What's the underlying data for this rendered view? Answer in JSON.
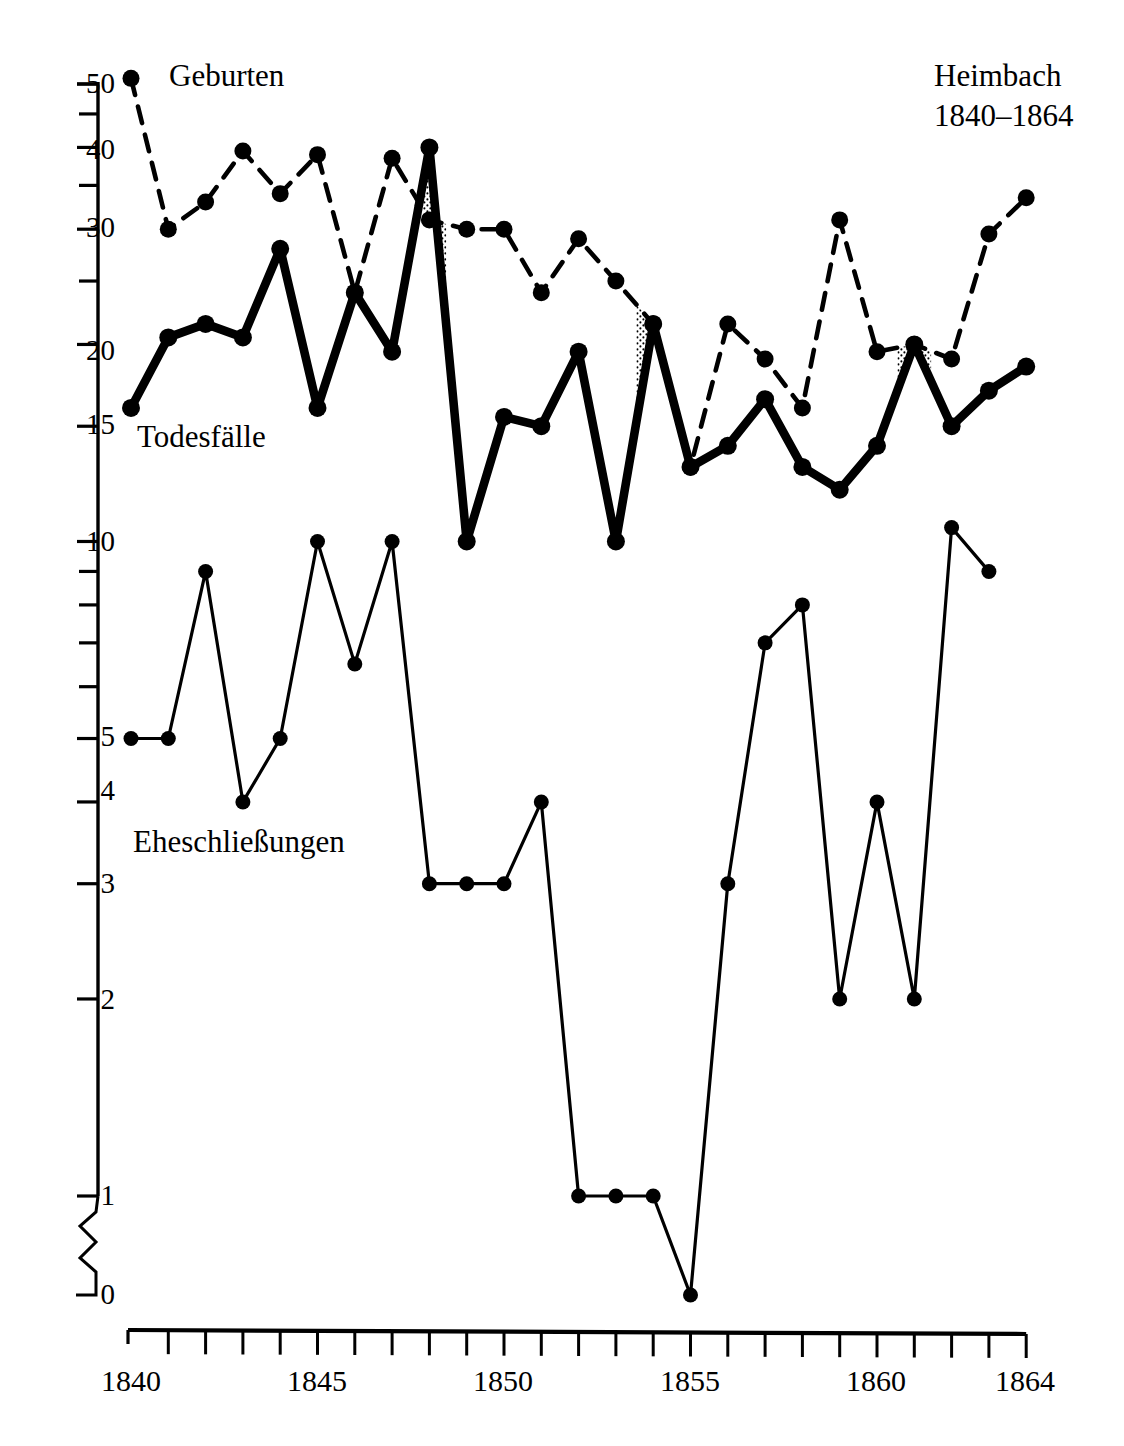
{
  "chart_data": {
    "type": "line",
    "title": "Heimbach",
    "subtitle": "1840–1864",
    "xlabel": "",
    "ylabel": "",
    "scale": "logarithmic",
    "grid": false,
    "legend_position": "inline-annotations",
    "axis_break": "between 1 and 0 on y-axis (zigzag symbol)",
    "xlim": [
      1840,
      1864
    ],
    "ylim": [
      0,
      51
    ],
    "x": [
      1840,
      1841,
      1842,
      1843,
      1844,
      1845,
      1846,
      1847,
      1848,
      1849,
      1850,
      1851,
      1852,
      1853,
      1854,
      1855,
      1856,
      1857,
      1858,
      1859,
      1860,
      1861,
      1862,
      1863,
      1864
    ],
    "xticks_labeled": [
      "1840",
      "1845",
      "1850",
      "1855",
      "1860",
      "1864"
    ],
    "yticks_labeled": [
      "50",
      "40",
      "30",
      "20",
      "15",
      "10",
      "5",
      "4",
      "3",
      "2",
      "1",
      "0"
    ],
    "yticks_minor": [
      45,
      35,
      25,
      9,
      8,
      7,
      6
    ],
    "series": [
      {
        "name": "Geburten",
        "style": "dashed",
        "marker": "filled-circle",
        "values": [
          51,
          30,
          33,
          39.5,
          34,
          39,
          24,
          38.5,
          31,
          30,
          30,
          24,
          29,
          25,
          21.5,
          13,
          21.5,
          19,
          16,
          31,
          19.5,
          20,
          19,
          29.5,
          33.5
        ]
      },
      {
        "name": "Todesfälle",
        "style": "thick-solid",
        "marker": "filled-circle",
        "values": [
          16,
          20.5,
          21.5,
          20.5,
          28,
          16,
          24,
          19.5,
          40,
          10,
          15.5,
          15,
          19.5,
          10,
          21.5,
          13,
          14,
          16.5,
          13,
          12,
          14,
          20,
          15,
          17,
          18.5
        ]
      },
      {
        "name": "Eheschließungen",
        "style": "thin-solid",
        "marker": "filled-circle",
        "values": [
          5,
          5,
          9,
          4,
          5,
          10,
          6.5,
          10,
          3,
          3,
          3,
          4,
          1,
          1,
          1,
          0,
          3,
          7,
          8,
          2,
          4,
          2,
          10.5,
          9,
          null
        ]
      }
    ],
    "shaded_regions": [
      {
        "label": "deaths exceed births",
        "from": 1847.6,
        "to": 1848.45,
        "fill": "stipple"
      },
      {
        "label": "deaths exceed births",
        "from": 1853.55,
        "to": 1855.0,
        "fill": "stipple"
      },
      {
        "label": "deaths exceed births",
        "from": 1860.55,
        "to": 1861.45,
        "fill": "stipple"
      }
    ]
  },
  "annotations": {
    "births_label": "Geburten",
    "deaths_label": "Todesfälle",
    "marriages_label": "Eheschließungen"
  },
  "ytick_labels": {
    "t50": "50",
    "t40": "40",
    "t30": "30",
    "t20": "20",
    "t15": "15",
    "t10": "10",
    "t5": "5",
    "t4": "4",
    "t3": "3",
    "t2": "2",
    "t1": "1",
    "t0": "0"
  },
  "xtick_labels": {
    "x1840": "1840",
    "x1845": "1845",
    "x1850": "1850",
    "x1855": "1855",
    "x1860": "1860",
    "x1864": "1864"
  },
  "colors": {
    "ink": "#000000",
    "background": "#ffffff"
  }
}
